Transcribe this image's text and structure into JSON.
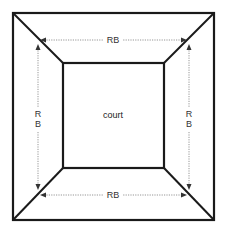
{
  "diagram": {
    "type": "court_layout",
    "center_label": "court",
    "dimension_labels": {
      "top": "RB",
      "bottom": "RB",
      "left": [
        "R",
        "B"
      ],
      "right": [
        "R",
        "B"
      ]
    },
    "outer_square": {
      "x1": 13,
      "y1": 13,
      "x2": 214,
      "y2": 220
    },
    "inner_square": {
      "x1": 63,
      "y1": 63,
      "x2": 164,
      "y2": 168
    },
    "colors": {
      "line": "#1a1a1a",
      "dimension_line": "#8a8a8a",
      "text": "#333333",
      "background": "#ffffff"
    }
  }
}
